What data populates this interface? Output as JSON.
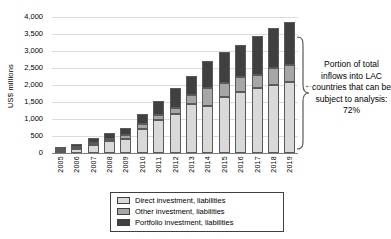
{
  "chart_data": {
    "type": "bar",
    "stacked": true,
    "title": "",
    "ylabel": "US$ millions",
    "xlabel": "",
    "ylim": [
      0,
      4000
    ],
    "ytick_step": 500,
    "yticks": [
      "4,000",
      "3,500",
      "3,000",
      "2,500",
      "2,000",
      "1,500",
      "1,000",
      "500",
      "0"
    ],
    "grid": true,
    "legend_position": "bottom",
    "categories": [
      "2005",
      "2006",
      "2007",
      "2008",
      "2009",
      "2010",
      "2011",
      "2012",
      "2013",
      "2014",
      "2015",
      "2016",
      "2017",
      "2018",
      "2019"
    ],
    "series": [
      {
        "name": "Direct investment, liabilities",
        "color": "#d9d9d9",
        "values": [
          50,
          130,
          240,
          340,
          420,
          720,
          980,
          1150,
          1430,
          1380,
          1660,
          1800,
          1900,
          2000,
          2100
        ]
      },
      {
        "name": "Other investment, liabilities",
        "color": "#a6a6a6",
        "values": [
          10,
          20,
          30,
          60,
          100,
          120,
          150,
          170,
          270,
          540,
          410,
          430,
          400,
          500,
          500
        ]
      },
      {
        "name": "Portfolio investment, liabilities",
        "color": "#404040",
        "values": [
          20,
          90,
          140,
          190,
          230,
          300,
          410,
          580,
          580,
          780,
          890,
          950,
          1140,
          1180,
          1250
        ]
      }
    ],
    "totals": [
      80,
      240,
      410,
      590,
      750,
      1140,
      1540,
      1900,
      2280,
      2700,
      2960,
      3180,
      3440,
      3680,
      3850
    ]
  },
  "annotation": {
    "text": "Portion of total inflows into LAC countries that can be subject to analysis: 72%",
    "arrow_glyph": "←"
  },
  "colors": {
    "gridline": "#dcdcdc",
    "axis": "#7f7f7f",
    "segment_border": "#5a5a5a",
    "brace": "#595959"
  }
}
